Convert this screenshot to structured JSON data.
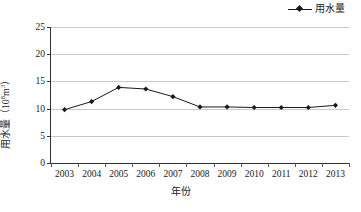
{
  "legend": {
    "label": "用水量",
    "marker": "diamond-marker",
    "line_color": "#1a1a1a"
  },
  "axes": {
    "x_title": "年份",
    "y_title_main": "用水量",
    "y_title_unit_open": "（10",
    "y_title_unit_exp": "8",
    "y_title_unit_close": "m",
    "y_title_unit_exp2": "3",
    "y_title_unit_end": "）"
  },
  "chart_data": {
    "type": "line",
    "title": "",
    "xlabel": "年份",
    "ylabel": "用水量（10⁸m³）",
    "categories": [
      "2003",
      "2004",
      "2005",
      "2006",
      "2007",
      "2008",
      "2009",
      "2010",
      "2011",
      "2012",
      "2013"
    ],
    "series": [
      {
        "name": "用水量",
        "values": [
          9.8,
          11.3,
          13.9,
          13.6,
          12.2,
          10.3,
          10.3,
          10.2,
          10.2,
          10.2,
          10.6
        ],
        "color": "#1a1a1a",
        "marker": "diamond"
      }
    ],
    "ylim": [
      0,
      25
    ],
    "yticks": [
      0,
      5,
      10,
      15,
      20,
      25
    ],
    "ytick_labels": [
      "0",
      "5",
      "10",
      "15",
      "20",
      "25"
    ],
    "grid": true,
    "grid_axis": "y",
    "grid_color": "#c9c9c9",
    "legend_position": "top-right"
  }
}
